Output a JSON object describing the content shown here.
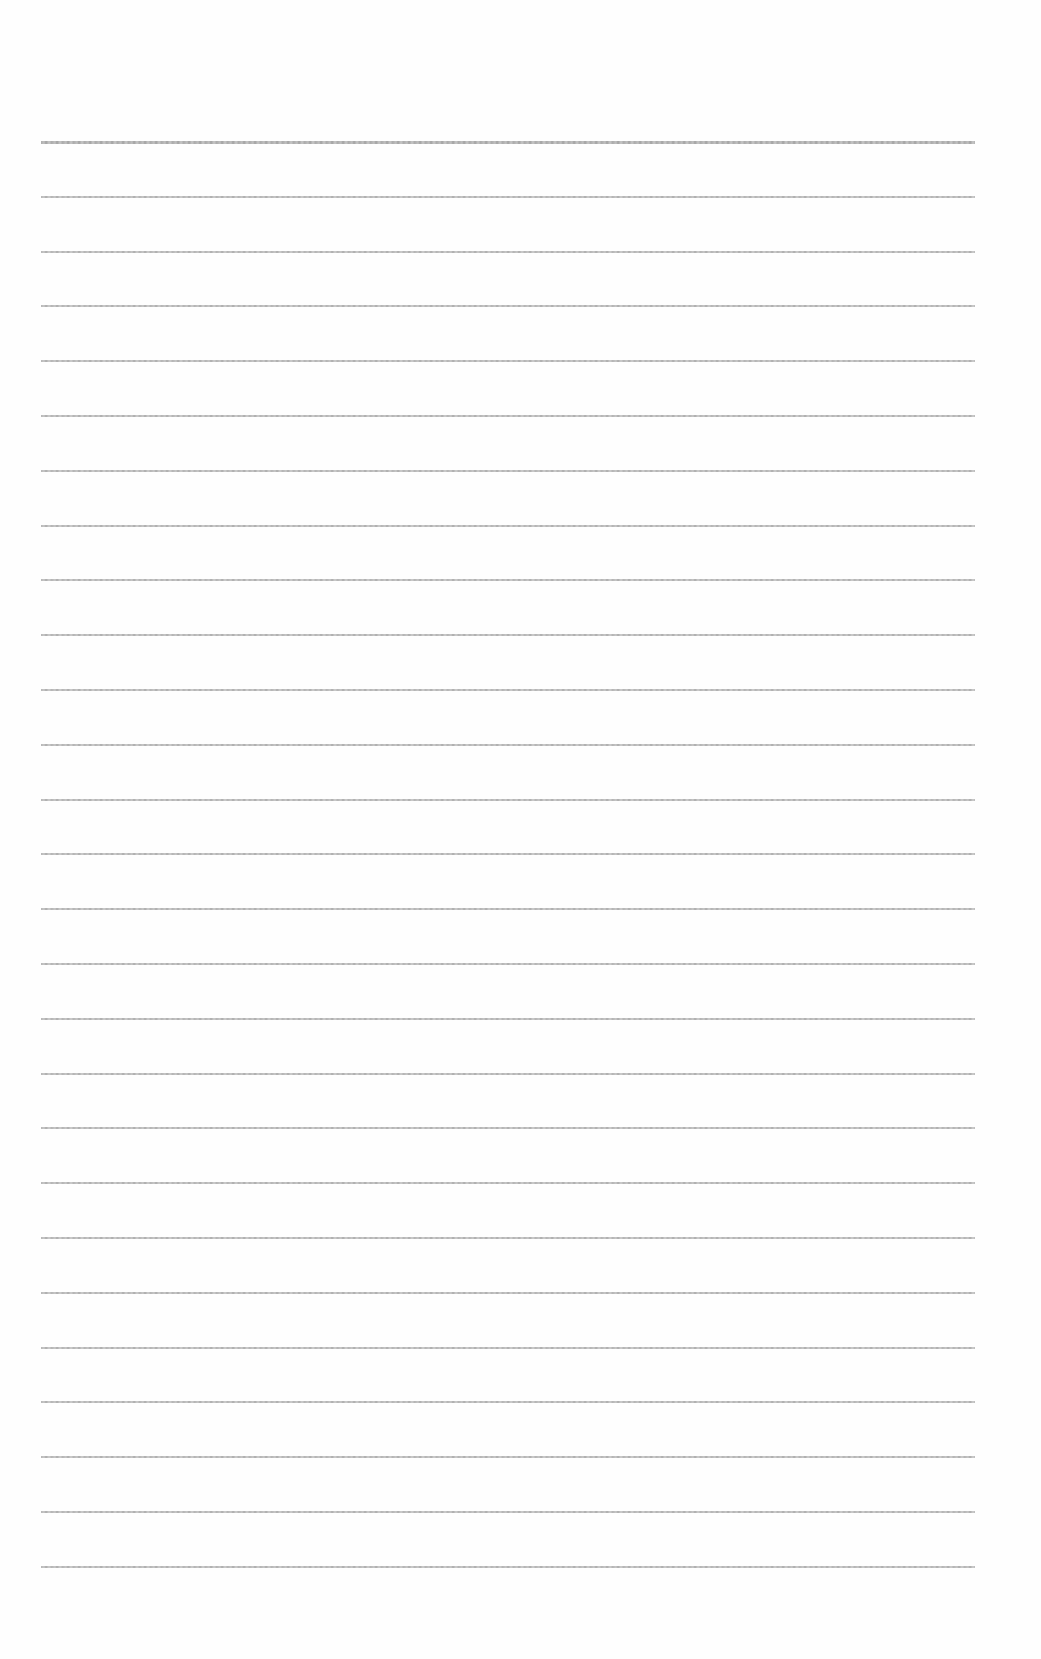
{
  "document": {
    "type": "lined-paper",
    "background_color": "#fefefe",
    "line_color": "#a9a9a9",
    "line_count": 27,
    "first_line_y": 141,
    "line_spacing": 54.8,
    "line_left_x": 41,
    "line_right_x": 975,
    "text_content": ""
  }
}
